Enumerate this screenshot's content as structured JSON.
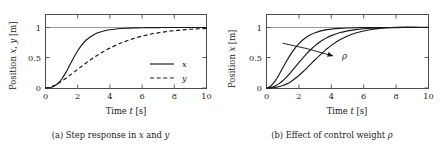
{
  "figure": {
    "background_color": "#ffffff",
    "foreground_color": "#1a1a1a",
    "grid_color": "#7f7f7f",
    "frame_color": "#4d4d4d"
  },
  "subfigures": [
    {
      "key": "a",
      "caption_label": "(a)",
      "caption_text_1": "Step response in",
      "caption_math_1": "x",
      "caption_text_2": "and",
      "caption_math_2": "y",
      "caption_full": "(a) Step response in x and y",
      "chart_data": {
        "type": "line",
        "title": "",
        "xlabel": "Time t [s]",
        "xlabel_text": "Time",
        "xlabel_math": "t",
        "xlabel_unit": "[s]",
        "ylabel": "Position x, y [m]",
        "ylabel_text": "Position",
        "ylabel_math_1": "x",
        "ylabel_math_2": "y",
        "ylabel_unit": "[m]",
        "xlim": [
          0,
          10
        ],
        "ylim": [
          -0.08,
          1.35
        ],
        "xticks": [
          0,
          2,
          4,
          6,
          8,
          10
        ],
        "xticklabels": [
          "0",
          "2",
          "4",
          "6",
          "8",
          "10"
        ],
        "yticks": [
          0,
          0.5,
          1
        ],
        "yticklabels": [
          "0",
          "0.5",
          "1"
        ],
        "grid": true,
        "gridlines_y": [
          1
        ],
        "legend_position": "lower right",
        "x": [
          0,
          0.25,
          0.5,
          0.75,
          1,
          1.25,
          1.5,
          1.75,
          2,
          2.25,
          2.5,
          2.75,
          3,
          3.25,
          3.5,
          3.75,
          4,
          4.5,
          5,
          5.5,
          6,
          6.5,
          7,
          7.5,
          8,
          8.5,
          9,
          9.5,
          10
        ],
        "series": [
          {
            "name": "x",
            "label": "x",
            "style": "solid",
            "color": "#1a1a1a",
            "values": [
              0,
              0.005,
              0.025,
              0.07,
              0.145,
              0.25,
              0.375,
              0.5,
              0.615,
              0.71,
              0.785,
              0.84,
              0.882,
              0.912,
              0.934,
              0.951,
              0.963,
              0.979,
              0.988,
              0.993,
              0.996,
              0.998,
              0.999,
              1.0,
              1.0,
              1.0,
              1.0,
              1.0,
              1.0
            ]
          },
          {
            "name": "y",
            "label": "y",
            "style": "dashed",
            "color": "#1a1a1a",
            "values": [
              0,
              0.012,
              0.035,
              0.07,
              0.112,
              0.158,
              0.208,
              0.258,
              0.31,
              0.36,
              0.41,
              0.457,
              0.503,
              0.546,
              0.586,
              0.624,
              0.659,
              0.722,
              0.775,
              0.82,
              0.857,
              0.888,
              0.912,
              0.932,
              0.948,
              0.961,
              0.971,
              0.979,
              0.985
            ]
          }
        ]
      }
    },
    {
      "key": "b",
      "caption_label": "(b)",
      "caption_text_1": "Effect of control weight",
      "caption_math_1": "ρ",
      "caption_full": "(b) Effect of control weight ρ",
      "chart_data": {
        "type": "line",
        "title": "",
        "xlabel": "Time t [s]",
        "xlabel_text": "Time",
        "xlabel_math": "t",
        "xlabel_unit": "[s]",
        "ylabel": "Position x [m]",
        "ylabel_text": "Position",
        "ylabel_math_1": "x",
        "ylabel_unit": "[m]",
        "xlim": [
          0,
          10
        ],
        "ylim": [
          -0.08,
          1.35
        ],
        "xticks": [
          0,
          2,
          4,
          6,
          8,
          10
        ],
        "xticklabels": [
          "0",
          "2",
          "4",
          "6",
          "8",
          "10"
        ],
        "yticks": [
          0,
          0.5,
          1
        ],
        "yticklabels": [
          "0",
          "0.5",
          "1"
        ],
        "grid": true,
        "gridlines_y": [
          1
        ],
        "annotation": {
          "label": "ρ",
          "meaning": "increasing control weight rho",
          "arrow_from": [
            1.0,
            0.74
          ],
          "arrow_to": [
            4.1,
            0.53
          ]
        },
        "x": [
          0,
          0.25,
          0.5,
          0.75,
          1,
          1.25,
          1.5,
          1.75,
          2,
          2.25,
          2.5,
          2.75,
          3,
          3.25,
          3.5,
          3.75,
          4,
          4.5,
          5,
          5.5,
          6,
          6.5,
          7,
          7.5,
          8,
          8.5,
          9,
          9.5,
          10
        ],
        "series": [
          {
            "name": "rho_small",
            "label": "ρ small",
            "style": "solid",
            "color": "#1a1a1a",
            "values": [
              0,
              0.03,
              0.105,
              0.21,
              0.33,
              0.45,
              0.56,
              0.655,
              0.735,
              0.798,
              0.848,
              0.885,
              0.914,
              0.936,
              0.952,
              0.964,
              0.973,
              0.985,
              0.992,
              0.996,
              0.998,
              1.0,
              1.0,
              1.0,
              1.0,
              1.0,
              1.0,
              1.0,
              1.0
            ]
          },
          {
            "name": "rho_medium",
            "label": "ρ medium",
            "style": "solid",
            "color": "#1a1a1a",
            "values": [
              0,
              0.008,
              0.03,
              0.068,
              0.12,
              0.185,
              0.26,
              0.34,
              0.42,
              0.498,
              0.572,
              0.64,
              0.7,
              0.752,
              0.797,
              0.835,
              0.866,
              0.913,
              0.945,
              0.965,
              0.979,
              0.988,
              0.993,
              0.997,
              0.999,
              1.0,
              1.0,
              1.0,
              1.0
            ]
          },
          {
            "name": "rho_large",
            "label": "ρ large",
            "style": "solid",
            "color": "#1a1a1a",
            "values": [
              0,
              0.002,
              0.008,
              0.02,
              0.04,
              0.068,
              0.105,
              0.152,
              0.207,
              0.268,
              0.333,
              0.4,
              0.467,
              0.532,
              0.594,
              0.652,
              0.705,
              0.793,
              0.86,
              0.908,
              0.943,
              0.967,
              0.985,
              0.997,
              1.004,
              1.007,
              1.007,
              1.005,
              1.002
            ]
          }
        ]
      }
    }
  ]
}
